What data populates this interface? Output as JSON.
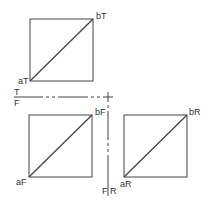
{
  "diagram": {
    "type": "orthographic-projection",
    "views": [
      {
        "name": "top",
        "start_label": "aT",
        "end_label": "bT"
      },
      {
        "name": "front",
        "start_label": "aF",
        "end_label": "bF"
      },
      {
        "name": "right",
        "start_label": "aR",
        "end_label": "bR"
      }
    ],
    "fold_lines": {
      "horizontal": {
        "upper": "T",
        "lower": "F"
      },
      "vertical": {
        "left": "F",
        "right": "R"
      }
    }
  },
  "colors": {
    "line": "#444444",
    "background": "#ffffff"
  }
}
